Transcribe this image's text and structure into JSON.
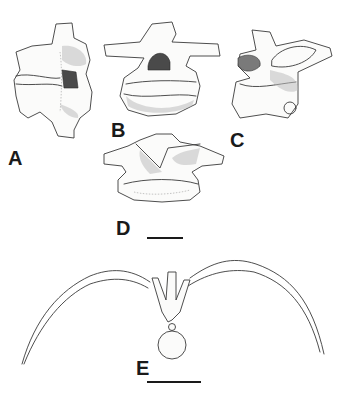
{
  "figure": {
    "panels": [
      {
        "id": "A",
        "label": "A",
        "view": "lateral vertebra"
      },
      {
        "id": "B",
        "label": "B",
        "view": "anterior vertebra"
      },
      {
        "id": "C",
        "label": "C",
        "view": "oblique vertebra"
      },
      {
        "id": "D",
        "label": "D",
        "view": "posterior vertebra"
      },
      {
        "id": "E",
        "label": "E",
        "view": "vertebra with ribs"
      }
    ],
    "scale_bars": [
      {
        "panel_group": "A-D",
        "label": ""
      },
      {
        "panel_group": "E",
        "label": ""
      }
    ],
    "colors": {
      "ink": "#3a3a3a",
      "background": "#ffffff",
      "label": "#1a1a1a"
    }
  }
}
